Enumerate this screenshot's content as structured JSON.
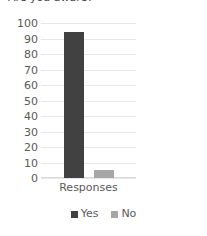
{
  "chart_data": {
    "type": "bar",
    "title": "Are you aware?",
    "title_clipped": true,
    "categories": [
      "Responses"
    ],
    "series": [
      {
        "name": "Yes",
        "values": [
          94
        ],
        "color": "#414141"
      },
      {
        "name": "No",
        "values": [
          5
        ],
        "color": "#a6a6a6"
      }
    ],
    "xlabel": "",
    "ylabel": "",
    "ylim": [
      0,
      100
    ],
    "yticks": [
      100,
      90,
      80,
      70,
      60,
      50,
      40,
      30,
      20,
      10,
      0
    ],
    "grid": true,
    "legend_position": "bottom"
  },
  "legend": {
    "items": [
      {
        "label": "Yes",
        "color": "#414141"
      },
      {
        "label": "No",
        "color": "#a6a6a6"
      }
    ]
  },
  "axis": {
    "category_label": "Responses"
  }
}
